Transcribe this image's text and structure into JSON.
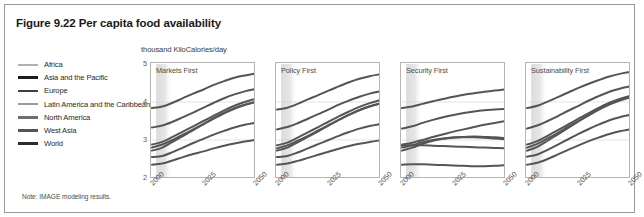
{
  "figure": {
    "title": "Figure 9.22 Per capita food availability",
    "note": "Note: IMAGE modeling results."
  },
  "legend": {
    "items": [
      {
        "label": "Africa",
        "color": "#b0b0b0",
        "weight": 2.0
      },
      {
        "label": "Asia and the Pacific",
        "color": "#1c1c1c",
        "weight": 3.0
      },
      {
        "label": "Europe",
        "color": "#3f3f3f",
        "weight": 2.8
      },
      {
        "label": "Latin America and the Caribbean",
        "color": "#9a9a9a",
        "weight": 2.0
      },
      {
        "label": "North America",
        "color": "#6e6e6e",
        "weight": 2.4
      },
      {
        "label": "West Asia",
        "color": "#555555",
        "weight": 2.4
      },
      {
        "label": "World",
        "color": "#2b2b2b",
        "weight": 2.6
      }
    ]
  },
  "chart_data": {
    "type": "line",
    "title": "Figure 9.22 Per capita food availability",
    "ylabel": "thousand KiloCalories/day",
    "xlabel": "",
    "ylim": [
      2,
      5
    ],
    "yticks": [
      2,
      3,
      4,
      5
    ],
    "xlim": [
      2000,
      2050
    ],
    "xticks": [
      2000,
      2025,
      2050
    ],
    "xticklabels": [
      "2000",
      "2025",
      "2050"
    ],
    "grid": "horizontal-light",
    "legend_position": "left-outside",
    "shaded_band": {
      "from": 2002,
      "to": 2010,
      "color": "#e8e8e8"
    },
    "x": [
      2000,
      2005,
      2010,
      2015,
      2020,
      2025,
      2030,
      2035,
      2040,
      2045,
      2050
    ],
    "panels": [
      {
        "name": "Markets First",
        "series": [
          {
            "name": "Africa",
            "values": [
              2.35,
              2.38,
              2.46,
              2.55,
              2.63,
              2.7,
              2.78,
              2.85,
              2.91,
              2.96,
              3.0
            ]
          },
          {
            "name": "Asia and the Pacific",
            "values": [
              2.72,
              2.8,
              2.95,
              3.1,
              3.26,
              3.42,
              3.58,
              3.72,
              3.84,
              3.93,
              4.0
            ]
          },
          {
            "name": "Europe",
            "values": [
              3.33,
              3.38,
              3.48,
              3.6,
              3.72,
              3.85,
              3.98,
              4.1,
              4.2,
              4.28,
              4.34
            ]
          },
          {
            "name": "Latin America and the Caribbean",
            "values": [
              2.55,
              2.58,
              2.68,
              2.8,
              2.92,
              3.03,
              3.14,
              3.24,
              3.33,
              3.4,
              3.45
            ]
          },
          {
            "name": "North America",
            "values": [
              3.84,
              3.88,
              3.98,
              4.1,
              4.22,
              4.33,
              4.45,
              4.55,
              4.64,
              4.7,
              4.75
            ]
          },
          {
            "name": "West Asia",
            "values": [
              2.88,
              2.95,
              3.08,
              3.22,
              3.36,
              3.5,
              3.64,
              3.78,
              3.9,
              4.0,
              4.08
            ]
          },
          {
            "name": "World",
            "values": [
              2.8,
              2.88,
              3.0,
              3.14,
              3.28,
              3.42,
              3.56,
              3.7,
              3.82,
              3.92,
              4.0
            ]
          }
        ]
      },
      {
        "name": "Policy First",
        "series": [
          {
            "name": "Africa",
            "values": [
              2.35,
              2.38,
              2.45,
              2.53,
              2.61,
              2.69,
              2.77,
              2.84,
              2.9,
              2.95,
              2.99
            ]
          },
          {
            "name": "Asia and the Pacific",
            "values": [
              2.72,
              2.8,
              2.94,
              3.08,
              3.23,
              3.38,
              3.53,
              3.67,
              3.79,
              3.89,
              3.96
            ]
          },
          {
            "name": "Europe",
            "values": [
              3.28,
              3.34,
              3.44,
              3.56,
              3.68,
              3.8,
              3.93,
              4.04,
              4.14,
              4.22,
              4.28
            ]
          },
          {
            "name": "Latin America and the Caribbean",
            "values": [
              2.55,
              2.58,
              2.67,
              2.78,
              2.89,
              3.0,
              3.11,
              3.21,
              3.3,
              3.37,
              3.42
            ]
          },
          {
            "name": "North America",
            "values": [
              3.8,
              3.85,
              3.95,
              4.07,
              4.18,
              4.3,
              4.41,
              4.52,
              4.61,
              4.68,
              4.73
            ]
          },
          {
            "name": "West Asia",
            "values": [
              2.86,
              2.93,
              3.06,
              3.2,
              3.34,
              3.48,
              3.62,
              3.75,
              3.87,
              3.97,
              4.05
            ]
          },
          {
            "name": "World",
            "values": [
              2.78,
              2.86,
              2.98,
              3.11,
              3.25,
              3.39,
              3.53,
              3.66,
              3.78,
              3.88,
              3.96
            ]
          }
        ]
      },
      {
        "name": "Security First",
        "series": [
          {
            "name": "Africa",
            "values": [
              2.35,
              2.36,
              2.36,
              2.35,
              2.34,
              2.33,
              2.32,
              2.31,
              2.31,
              2.32,
              2.34
            ]
          },
          {
            "name": "Asia and the Pacific",
            "values": [
              2.72,
              2.8,
              2.9,
              2.98,
              3.03,
              3.06,
              3.07,
              3.07,
              3.06,
              3.04,
              3.02
            ]
          },
          {
            "name": "Europe",
            "values": [
              3.3,
              3.36,
              3.45,
              3.53,
              3.6,
              3.66,
              3.71,
              3.75,
              3.78,
              3.8,
              3.82
            ]
          },
          {
            "name": "Latin America and the Caribbean",
            "values": [
              2.85,
              2.86,
              2.86,
              2.85,
              2.84,
              2.83,
              2.82,
              2.81,
              2.8,
              2.79,
              2.78
            ]
          },
          {
            "name": "North America",
            "values": [
              3.84,
              3.88,
              3.95,
              4.02,
              4.08,
              4.14,
              4.19,
              4.23,
              4.27,
              4.3,
              4.33
            ]
          },
          {
            "name": "West Asia",
            "values": [
              2.88,
              2.93,
              3.0,
              3.08,
              3.15,
              3.22,
              3.28,
              3.34,
              3.4,
              3.45,
              3.5
            ]
          },
          {
            "name": "World",
            "values": [
              2.8,
              2.86,
              2.94,
              3.0,
              3.04,
              3.07,
              3.08,
              3.09,
              3.08,
              3.07,
              3.05
            ]
          }
        ]
      },
      {
        "name": "Sustainability First",
        "series": [
          {
            "name": "Africa",
            "values": [
              2.35,
              2.4,
              2.5,
              2.62,
              2.74,
              2.86,
              2.97,
              3.07,
              3.16,
              3.23,
              3.28
            ]
          },
          {
            "name": "Asia and the Pacific",
            "values": [
              2.72,
              2.82,
              2.98,
              3.15,
              3.32,
              3.49,
              3.66,
              3.82,
              3.96,
              4.07,
              4.15
            ]
          },
          {
            "name": "Europe",
            "values": [
              3.3,
              3.38,
              3.5,
              3.63,
              3.77,
              3.9,
              4.04,
              4.16,
              4.27,
              4.35,
              4.41
            ]
          },
          {
            "name": "Latin America and the Caribbean",
            "values": [
              2.56,
              2.62,
              2.74,
              2.88,
              3.02,
              3.16,
              3.29,
              3.41,
              3.52,
              3.6,
              3.66
            ]
          },
          {
            "name": "North America",
            "values": [
              3.84,
              3.9,
              4.01,
              4.13,
              4.25,
              4.37,
              4.48,
              4.58,
              4.67,
              4.74,
              4.79
            ]
          },
          {
            "name": "West Asia",
            "values": [
              2.88,
              2.97,
              3.11,
              3.26,
              3.41,
              3.56,
              3.71,
              3.85,
              3.98,
              4.08,
              4.16
            ]
          },
          {
            "name": "World",
            "values": [
              2.8,
              2.9,
              3.04,
              3.19,
              3.35,
              3.5,
              3.65,
              3.8,
              3.93,
              4.04,
              4.12
            ]
          }
        ]
      }
    ]
  }
}
